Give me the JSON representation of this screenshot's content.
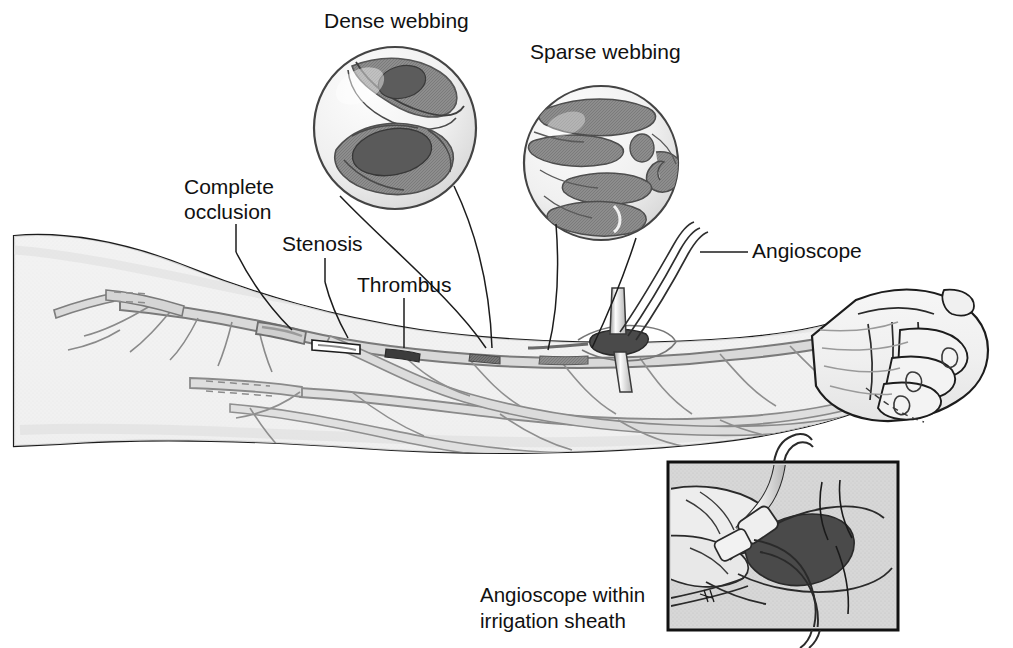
{
  "figure": {
    "background_color": "#ffffff",
    "ink_color": "#1a1a1a"
  },
  "labels": {
    "dense_webbing": "Dense webbing",
    "sparse_webbing": "Sparse webbing",
    "complete_occlusion_line1": "Complete",
    "complete_occlusion_line2": "occlusion",
    "stenosis": "Stenosis",
    "thrombus": "Thrombus",
    "angioscope": "Angioscope",
    "inset_caption_line1": "Angioscope within",
    "inset_caption_line2": "irrigation sheath"
  },
  "colors": {
    "skin_fill": "#f1f1f1",
    "skin_outline": "#1c1c1c",
    "vein_fill": "#dcdcdc",
    "vein_outline": "#6f6f6f",
    "thrombus_dark": "#3a3a3a",
    "web_dark": "#6a6a6a",
    "web_mid": "#9a9a9a",
    "circle_fill": "#f4f4f4",
    "circle_outline": "#444444",
    "inset_border": "#111111",
    "inset_fill": "#d6d6d6",
    "inset_wound": "#4a4a4a"
  },
  "insets": {
    "dense_circle": {
      "label_ref": "dense_webbing",
      "center_x": 395,
      "center_y": 128,
      "radius": 82,
      "description": "Angioscopic view showing dense fibrous webbing nearly filling the vein lumen"
    },
    "sparse_circle": {
      "label_ref": "sparse_webbing",
      "center_x": 601,
      "center_y": 163,
      "radius": 78,
      "description": "Angioscopic view showing sparse webbing with multiple open channels"
    },
    "photo_box": {
      "label_ref": "inset_caption",
      "x": 668,
      "y": 462,
      "width": 230,
      "height": 168,
      "description": "Surgical photograph of angioscope inserted within irrigation sheath through a venotomy"
    }
  },
  "anatomy": {
    "arm_description": "Left upper extremity from upper arm to closed fist, superficial venous network visible",
    "features": [
      "complete occlusion of vein segment",
      "stenosis of vein segment",
      "thrombus within vein",
      "angioscope entry site with irrigation tubing"
    ]
  }
}
